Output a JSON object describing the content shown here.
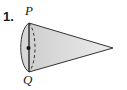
{
  "problem": {
    "number": "1."
  },
  "figure": {
    "type": "cone",
    "labels": {
      "top_point": "P",
      "bottom_point": "Q"
    },
    "colors": {
      "fill": "#dcdcdc",
      "stroke": "#333333",
      "center_dot": "#111111"
    }
  }
}
